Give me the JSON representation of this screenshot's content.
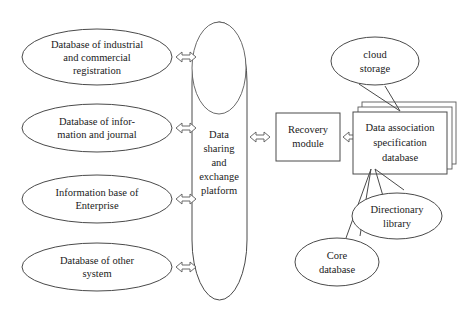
{
  "diagram": {
    "background_color": "#ffffff",
    "line_color": "#4a4a4a",
    "text_color": "#1a1a1a",
    "sources": [
      {
        "id": "industrial-commercial-registration",
        "lines": [
          "Database of industrial",
          "and commercial",
          "registration"
        ]
      },
      {
        "id": "information-journal",
        "lines": [
          "Database of infor-",
          "mation and journal"
        ]
      },
      {
        "id": "enterprise-information-base",
        "lines": [
          "Information base of",
          "Enterprise"
        ]
      },
      {
        "id": "other-system",
        "lines": [
          "Database of other",
          "system"
        ]
      }
    ],
    "platform": {
      "id": "data-sharing-exchange-platform",
      "lines": [
        "Data",
        "sharing",
        "and",
        "exchange",
        "platform"
      ]
    },
    "recovery_module": {
      "id": "recovery-module",
      "lines": [
        "Recovery",
        "module"
      ]
    },
    "database_stack": {
      "id": "data-association-specification-database",
      "lines": [
        "Data association",
        "specification",
        "database"
      ],
      "layers": 3
    },
    "callouts": [
      {
        "id": "cloud-storage",
        "lines": [
          "cloud",
          "storage"
        ]
      },
      {
        "id": "core-database",
        "lines": [
          "Core",
          "database"
        ]
      },
      {
        "id": "directionary-library",
        "lines": [
          "Directionary",
          "library"
        ]
      }
    ],
    "connectors": [
      {
        "id": "connector-source-1-platform",
        "type": "double-arrow"
      },
      {
        "id": "connector-source-2-platform",
        "type": "double-arrow"
      },
      {
        "id": "connector-source-3-platform",
        "type": "double-arrow"
      },
      {
        "id": "connector-source-4-platform",
        "type": "double-arrow"
      },
      {
        "id": "connector-platform-recovery",
        "type": "double-arrow"
      },
      {
        "id": "connector-recovery-database",
        "type": "double-arrow"
      }
    ]
  }
}
